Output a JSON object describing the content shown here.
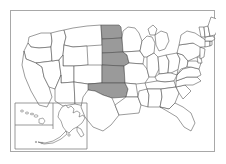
{
  "figure": {
    "kind": "choropleth-map",
    "region_scope": "United States of America",
    "background_color": "#ffffff",
    "frame_color": "#a8a8a8"
  },
  "legend": {
    "highlight_color": "#9a9a9a",
    "default_color": "#ffffff",
    "border_color": "#4a4a4a",
    "highlight_meaning": "selected states",
    "default_meaning": "unselected states"
  },
  "selection": {
    "count": 5,
    "highlighted_states": [
      "North Dakota",
      "South Dakota",
      "Nebraska",
      "Kansas",
      "Oklahoma"
    ],
    "highlighted_codes": [
      "ND",
      "SD",
      "NE",
      "KS",
      "OK"
    ],
    "grouping": "contiguous north-south band through the Great Plains"
  },
  "insets": [
    {
      "name": "Hawaii",
      "code": "HI",
      "highlighted": false
    },
    {
      "name": "Alaska",
      "code": "AK",
      "highlighted": false
    }
  ],
  "states": [
    {
      "code": "WA",
      "name": "Washington",
      "highlighted": false
    },
    {
      "code": "OR",
      "name": "Oregon",
      "highlighted": false
    },
    {
      "code": "CA",
      "name": "California",
      "highlighted": false
    },
    {
      "code": "NV",
      "name": "Nevada",
      "highlighted": false
    },
    {
      "code": "ID",
      "name": "Idaho",
      "highlighted": false
    },
    {
      "code": "MT",
      "name": "Montana",
      "highlighted": false
    },
    {
      "code": "WY",
      "name": "Wyoming",
      "highlighted": false
    },
    {
      "code": "UT",
      "name": "Utah",
      "highlighted": false
    },
    {
      "code": "AZ",
      "name": "Arizona",
      "highlighted": false
    },
    {
      "code": "CO",
      "name": "Colorado",
      "highlighted": false
    },
    {
      "code": "NM",
      "name": "New Mexico",
      "highlighted": false
    },
    {
      "code": "ND",
      "name": "North Dakota",
      "highlighted": true
    },
    {
      "code": "SD",
      "name": "South Dakota",
      "highlighted": true
    },
    {
      "code": "NE",
      "name": "Nebraska",
      "highlighted": true
    },
    {
      "code": "KS",
      "name": "Kansas",
      "highlighted": true
    },
    {
      "code": "OK",
      "name": "Oklahoma",
      "highlighted": true
    },
    {
      "code": "TX",
      "name": "Texas",
      "highlighted": false
    },
    {
      "code": "MN",
      "name": "Minnesota",
      "highlighted": false
    },
    {
      "code": "IA",
      "name": "Iowa",
      "highlighted": false
    },
    {
      "code": "MO",
      "name": "Missouri",
      "highlighted": false
    },
    {
      "code": "AR",
      "name": "Arkansas",
      "highlighted": false
    },
    {
      "code": "LA",
      "name": "Louisiana",
      "highlighted": false
    },
    {
      "code": "WI",
      "name": "Wisconsin",
      "highlighted": false
    },
    {
      "code": "IL",
      "name": "Illinois",
      "highlighted": false
    },
    {
      "code": "MI",
      "name": "Michigan",
      "highlighted": false
    },
    {
      "code": "IN",
      "name": "Indiana",
      "highlighted": false
    },
    {
      "code": "OH",
      "name": "Ohio",
      "highlighted": false
    },
    {
      "code": "KY",
      "name": "Kentucky",
      "highlighted": false
    },
    {
      "code": "TN",
      "name": "Tennessee",
      "highlighted": false
    },
    {
      "code": "MS",
      "name": "Mississippi",
      "highlighted": false
    },
    {
      "code": "AL",
      "name": "Alabama",
      "highlighted": false
    },
    {
      "code": "GA",
      "name": "Georgia",
      "highlighted": false
    },
    {
      "code": "FL",
      "name": "Florida",
      "highlighted": false
    },
    {
      "code": "SC",
      "name": "South Carolina",
      "highlighted": false
    },
    {
      "code": "NC",
      "name": "North Carolina",
      "highlighted": false
    },
    {
      "code": "VA",
      "name": "Virginia",
      "highlighted": false
    },
    {
      "code": "WV",
      "name": "West Virginia",
      "highlighted": false
    },
    {
      "code": "MD",
      "name": "Maryland",
      "highlighted": false
    },
    {
      "code": "DE",
      "name": "Delaware",
      "highlighted": false
    },
    {
      "code": "PA",
      "name": "Pennsylvania",
      "highlighted": false
    },
    {
      "code": "NJ",
      "name": "New Jersey",
      "highlighted": false
    },
    {
      "code": "NY",
      "name": "New York",
      "highlighted": false
    },
    {
      "code": "CT",
      "name": "Connecticut",
      "highlighted": false
    },
    {
      "code": "RI",
      "name": "Rhode Island",
      "highlighted": false
    },
    {
      "code": "MA",
      "name": "Massachusetts",
      "highlighted": false
    },
    {
      "code": "VT",
      "name": "Vermont",
      "highlighted": false
    },
    {
      "code": "NH",
      "name": "New Hampshire",
      "highlighted": false
    },
    {
      "code": "ME",
      "name": "Maine",
      "highlighted": false
    }
  ]
}
